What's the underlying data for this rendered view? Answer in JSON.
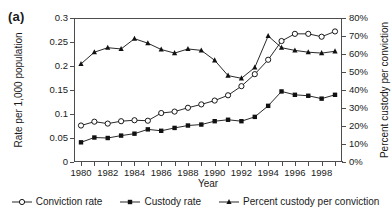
{
  "panel": {
    "label": "(a)"
  },
  "axes": {
    "x": {
      "title": "Year",
      "tick_labels": [
        "1980",
        "1982",
        "1984",
        "1986",
        "1988",
        "1990",
        "1992",
        "1994",
        "1996",
        "1998"
      ],
      "min": 1980,
      "max": 1999
    },
    "y_left": {
      "title": "Rate per 1,000 population",
      "tick_labels": [
        "0.3",
        "0.25",
        "0.2",
        "0.15",
        "0.1",
        "0.05",
        "0"
      ],
      "min": 0,
      "max": 0.3
    },
    "y_right": {
      "title": "Percent custody per conviction",
      "tick_labels": [
        "80%",
        "70%",
        "60%",
        "50%",
        "40%",
        "30%",
        "20%",
        "10%",
        "0%"
      ],
      "min": 0,
      "max": 80
    }
  },
  "legend": {
    "items": [
      {
        "label": "Conviction rate",
        "marker": "open-circle-marker",
        "color": "#000000"
      },
      {
        "label": "Custody rate",
        "marker": "filled-square-marker",
        "color": "#000000"
      },
      {
        "label": "Percent custody per conviction",
        "marker": "filled-triangle-marker",
        "color": "#000000"
      }
    ]
  },
  "chart_data": {
    "type": "line",
    "title": "",
    "subtitle": "",
    "xlabel": "Year",
    "ylabel": "Rate per 1,000 population",
    "y2label": "Percent custody per conviction",
    "xlim": [
      1980,
      1999
    ],
    "ylim": [
      0,
      0.3
    ],
    "y2lim": [
      0,
      80
    ],
    "grid": false,
    "legend_position": "bottom-center",
    "x": [
      1980,
      1981,
      1982,
      1983,
      1984,
      1985,
      1986,
      1987,
      1988,
      1989,
      1990,
      1991,
      1992,
      1993,
      1994,
      1995,
      1996,
      1997,
      1998,
      1999
    ],
    "series": [
      {
        "name": "Conviction rate",
        "axis": "left",
        "marker": "open-circle",
        "units": "per 1,000 population",
        "values": [
          0.076,
          0.084,
          0.08,
          0.085,
          0.087,
          0.086,
          0.102,
          0.105,
          0.113,
          0.12,
          0.128,
          0.139,
          0.158,
          0.183,
          0.213,
          0.252,
          0.267,
          0.267,
          0.261,
          0.272
        ]
      },
      {
        "name": "Custody rate",
        "axis": "left",
        "marker": "filled-square",
        "units": "per 1,000 population",
        "values": [
          0.041,
          0.051,
          0.05,
          0.055,
          0.059,
          0.068,
          0.065,
          0.071,
          0.076,
          0.078,
          0.085,
          0.088,
          0.085,
          0.094,
          0.117,
          0.147,
          0.14,
          0.138,
          0.132,
          0.14
        ]
      },
      {
        "name": "Percent custody per conviction",
        "axis": "right",
        "marker": "filled-triangle",
        "units": "percent",
        "values": [
          54.5,
          61.0,
          63.5,
          62.8,
          68.5,
          66.0,
          62.5,
          60.5,
          62.8,
          62.0,
          56.5,
          48.0,
          46.5,
          52.5,
          70.0,
          63.5,
          62.0,
          61.0,
          60.5,
          61.5
        ]
      }
    ]
  }
}
